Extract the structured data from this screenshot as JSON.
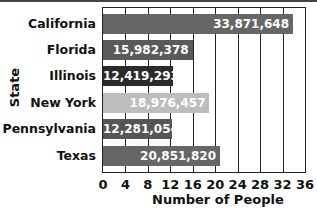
{
  "chart_data": {
    "type": "bar",
    "orientation": "horizontal",
    "title": "",
    "xlabel": "Number of People",
    "ylabel": "State",
    "xlim": [
      0,
      36
    ],
    "x_ticks": [
      "0",
      "4",
      "8",
      "12",
      "16",
      "20",
      "24",
      "28",
      "32",
      "36"
    ],
    "grid": true,
    "categories": [
      "California",
      "Florida",
      "Illinois",
      "New York",
      "Pennsylvania",
      "Texas"
    ],
    "values": [
      33871648,
      15982378,
      12419293,
      18976457,
      12281054,
      20851820
    ],
    "value_labels": [
      "33,871,648",
      "15,982,378",
      "12,419,293",
      "18,976,457",
      "12,281,054",
      "20,851,820"
    ],
    "axis_values_millions": [
      33.87,
      15.98,
      12.42,
      18.98,
      12.28,
      20.85
    ],
    "bar_colors": [
      "#666666",
      "#5a5a5a",
      "#2b2b2b",
      "#bdbdbd",
      "#555555",
      "#666666"
    ],
    "legend": null
  }
}
